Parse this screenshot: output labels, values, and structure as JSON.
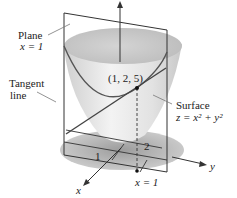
{
  "figure": {
    "labels": {
      "plane_title": "Plane",
      "plane_eq": "x = 1",
      "tangent_line_1": "Tangent",
      "tangent_line_2": "line",
      "point": "(1, 2, 5)",
      "surface_title": "Surface",
      "surface_eq": "z = x² + y²",
      "tick_x": "1",
      "tick_y": "2",
      "x_eq_1": "x = 1",
      "axis_x": "x",
      "axis_y": "y"
    },
    "colors": {
      "line": "#333333",
      "surface_light": "#e6e6e6",
      "surface_dark": "#9a9a9a",
      "shadow": "#b8b8b8"
    }
  }
}
